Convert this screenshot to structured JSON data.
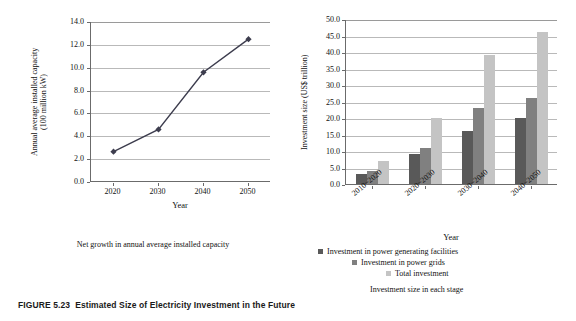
{
  "figure": {
    "caption_number": "FIGURE 5.23",
    "caption_text": "Estimated Size of Electricity Investment in the Future"
  },
  "colors": {
    "series_power_generating": "#595959",
    "series_power_grids": "#808080",
    "series_total": "#c4c4c4",
    "line": "#3d3d4e",
    "grid": "#b9b9b9",
    "axis": "#6b6b6b"
  },
  "left_panel": {
    "sub_caption": "Net growth in annual average installed capacity"
  },
  "right_panel": {
    "legend": [
      {
        "label": "Investment in power generating facilities",
        "color": "#595959",
        "indent": 0
      },
      {
        "label": "Investment in power grids",
        "color": "#808080",
        "indent": 34
      },
      {
        "label": "Total investment",
        "color": "#c4c4c4",
        "indent": 68
      }
    ],
    "legend_caption": "Investment size in each stage"
  },
  "chart_data": [
    {
      "type": "line",
      "title": "Net growth in annual average installed capacity",
      "xlabel": "Year",
      "ylabel": "Annual average installed capacity (100 million kW)",
      "ylabel_line1": "Annual average installed capacity",
      "ylabel_line2": "(100 million kW)",
      "categories": [
        "2020",
        "2030",
        "2040",
        "2050"
      ],
      "x": [
        2020,
        2030,
        2040,
        2050
      ],
      "values": [
        2.65,
        4.6,
        9.6,
        12.5
      ],
      "yticks": [
        "0.0",
        "2.0",
        "4.0",
        "6.0",
        "8.0",
        "10.0",
        "12.0",
        "14.0"
      ],
      "ytick_values": [
        0,
        2,
        4,
        6,
        8,
        10,
        12,
        14
      ],
      "ylim": [
        0,
        14
      ],
      "grid": true,
      "marker": "diamond",
      "legend": "none"
    },
    {
      "type": "bar",
      "title": "Investment size in each stage",
      "xlabel": "Year",
      "ylabel": "Investment size (US$ trillion)",
      "categories": [
        "2010~2020",
        "2020~2030",
        "2030~2040",
        "2040~2050"
      ],
      "series": [
        {
          "name": "Investment in power generating facilities",
          "values": [
            3,
            9,
            16,
            20
          ]
        },
        {
          "name": "Investment in power grids",
          "values": [
            4,
            11,
            23,
            26
          ]
        },
        {
          "name": "Total investment",
          "values": [
            7,
            20,
            39,
            46
          ]
        }
      ],
      "yticks": [
        "0.0",
        "5.0",
        "10.0",
        "15.0",
        "20.0",
        "25.0",
        "30.0",
        "35.0",
        "40.0",
        "45.0",
        "50.0"
      ],
      "ytick_values": [
        0,
        5,
        10,
        15,
        20,
        25,
        30,
        35,
        40,
        45,
        50
      ],
      "ylim": [
        0,
        50
      ],
      "grid": true,
      "legend_position": "bottom"
    }
  ]
}
